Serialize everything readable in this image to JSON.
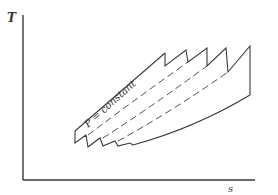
{
  "diagram": {
    "y_axis_label": "T",
    "x_axis_label": "s",
    "annotation": "P = constant",
    "line_color": "#3a3a3a",
    "stages": 5
  }
}
